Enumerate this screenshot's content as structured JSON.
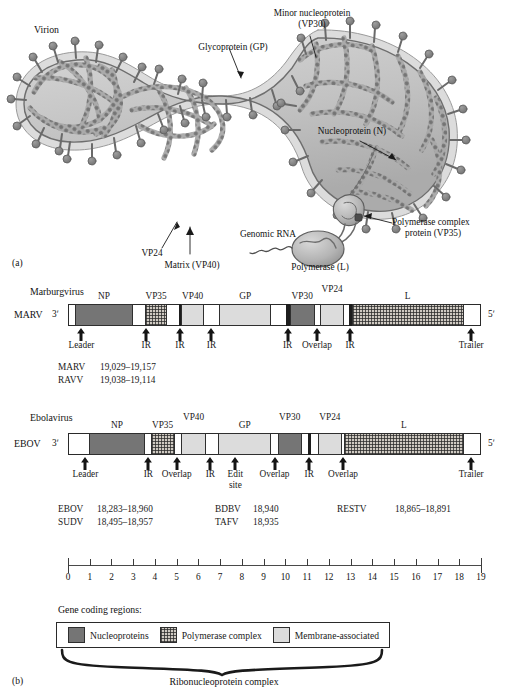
{
  "figure": {
    "panel_a_mark": "(a)",
    "panel_b_mark": "(b)",
    "virion_title": "Virion"
  },
  "virion_labels": {
    "minor_nucleoprotein": "Minor nucleoprotein",
    "minor_nucleoprotein_sub": "(VP30)",
    "glycoprotein": "Glycoprotein (GP)",
    "nucleoprotein": "Nucleoprotein (N)",
    "polymerase_complex": "Polymerase complex",
    "polymerase_complex_sub": "protein (VP35)",
    "genomic_rna": "Genomic RNA",
    "polymerase": "Polymerase (L)",
    "matrix": "Matrix (VP40)",
    "vp24": "VP24"
  },
  "marburg": {
    "genus": "Marburgvirus",
    "species": "MARV",
    "end_3": "3ʹ",
    "end_5": "5ʹ",
    "segments": [
      {
        "name": "",
        "type": "spacer",
        "x0": 0.0,
        "x1": 0.3
      },
      {
        "name": "NP",
        "type": "np",
        "x0": 0.3,
        "x1": 3.0
      },
      {
        "name": "",
        "type": "spacer",
        "x0": 3.0,
        "x1": 3.55
      },
      {
        "name": "VP35",
        "type": "poly",
        "x0": 3.55,
        "x1": 4.55
      },
      {
        "name": "",
        "type": "spacer",
        "x0": 4.55,
        "x1": 5.1
      },
      {
        "name": "",
        "type": "thin",
        "x0": 5.1,
        "x1": 5.22
      },
      {
        "name": "VP40",
        "type": "mem",
        "x0": 5.22,
        "x1": 6.25
      },
      {
        "name": "",
        "type": "spacer",
        "x0": 6.25,
        "x1": 6.95
      },
      {
        "name": "GP",
        "type": "mem",
        "x0": 6.95,
        "x1": 9.35
      },
      {
        "name": "",
        "type": "spacer",
        "x0": 9.35,
        "x1": 10.05
      },
      {
        "name": "",
        "type": "thin",
        "x0": 10.05,
        "x1": 10.2
      },
      {
        "name": "VP30",
        "type": "np",
        "x0": 10.2,
        "x1": 11.35
      },
      {
        "name": "",
        "type": "spacer",
        "x0": 11.35,
        "x1": 11.6
      },
      {
        "name": "VP24",
        "type": "mem",
        "x0": 11.6,
        "x1": 12.7
      },
      {
        "name": "",
        "type": "spacer",
        "x0": 12.7,
        "x1": 12.92
      },
      {
        "name": "",
        "type": "thin",
        "x0": 12.92,
        "x1": 13.05
      },
      {
        "name": "L",
        "type": "poly",
        "x0": 13.05,
        "x1": 18.2
      },
      {
        "name": "",
        "type": "spacer",
        "x0": 18.2,
        "x1": 19.0
      }
    ],
    "markers": [
      {
        "label": "Leader",
        "x": 0.62
      },
      {
        "label": "IR",
        "x": 3.6
      },
      {
        "label": "IR",
        "x": 5.15
      },
      {
        "label": "IR",
        "x": 6.6
      },
      {
        "label": "IR",
        "x": 10.1
      },
      {
        "label": "Overlap",
        "x": 11.45
      },
      {
        "label": "IR",
        "x": 12.98
      },
      {
        "label": "Trailer",
        "x": 18.55
      }
    ],
    "sizes": [
      {
        "species": "MARV",
        "range": "19,029–19,157"
      },
      {
        "species": "RAVV",
        "range": "19,038–19,114"
      }
    ]
  },
  "ebola": {
    "genus": "Ebolavirus",
    "species": "EBOV",
    "end_3": "3ʹ",
    "end_5": "5ʹ",
    "segments": [
      {
        "name": "",
        "type": "spacer",
        "x0": 0.0,
        "x1": 0.95
      },
      {
        "name": "NP",
        "type": "np",
        "x0": 0.95,
        "x1": 3.55
      },
      {
        "name": "",
        "type": "spacer",
        "x0": 3.55,
        "x1": 3.8
      },
      {
        "name": "VP35",
        "type": "poly",
        "x0": 3.8,
        "x1": 4.9
      },
      {
        "name": "",
        "type": "spacer",
        "x0": 4.9,
        "x1": 5.2
      },
      {
        "name": "VP40",
        "type": "mem",
        "x0": 5.2,
        "x1": 6.35
      },
      {
        "name": "",
        "type": "spacer",
        "x0": 6.35,
        "x1": 6.9
      },
      {
        "name": "GP",
        "type": "mem",
        "x0": 6.9,
        "x1": 9.35
      },
      {
        "name": "",
        "type": "spacer",
        "x0": 9.35,
        "x1": 9.65
      },
      {
        "name": "VP30",
        "type": "np",
        "x0": 9.65,
        "x1": 10.75
      },
      {
        "name": "",
        "type": "spacer",
        "x0": 10.75,
        "x1": 11.05
      },
      {
        "name": "",
        "type": "thin",
        "x0": 11.05,
        "x1": 11.2
      },
      {
        "name": "",
        "type": "spacer",
        "x0": 11.2,
        "x1": 11.5
      },
      {
        "name": "VP24",
        "type": "mem",
        "x0": 11.5,
        "x1": 12.6
      },
      {
        "name": "L",
        "type": "poly",
        "x0": 12.7,
        "x1": 18.2
      },
      {
        "name": "",
        "type": "spacer",
        "x0": 18.2,
        "x1": 19.0
      }
    ],
    "markers": [
      {
        "label": "Leader",
        "x": 0.8
      },
      {
        "label": "IR",
        "x": 3.7
      },
      {
        "label": "Overlap",
        "x": 5.0
      },
      {
        "label": "IR",
        "x": 6.55
      },
      {
        "label": "Edit\nsite",
        "x": 7.7
      },
      {
        "label": "Overlap",
        "x": 9.5
      },
      {
        "label": "IR",
        "x": 11.1
      },
      {
        "label": "Overlap",
        "x": 12.65
      },
      {
        "label": "Trailer",
        "x": 18.55
      }
    ],
    "sizes": [
      {
        "species": "EBOV",
        "range": "18,283–18,960"
      },
      {
        "species": "SUDV",
        "range": "18,495–18,957"
      },
      {
        "species": "BDBV",
        "range": "18,940"
      },
      {
        "species": "TAFV",
        "range": "18,935"
      },
      {
        "species": "RESTV",
        "range": "18,865–18,891"
      }
    ]
  },
  "scale": {
    "min": 0,
    "max": 19,
    "ticks": [
      "0",
      "1",
      "2",
      "3",
      "4",
      "5",
      "6",
      "7",
      "8",
      "9",
      "10",
      "11",
      "12",
      "13",
      "14",
      "15",
      "16",
      "17",
      "18",
      "19"
    ],
    "unit_note": ""
  },
  "legend": {
    "title": "Gene coding regions:",
    "items": [
      {
        "label": "Nucleoproteins",
        "swatch": "np",
        "color": "#757575"
      },
      {
        "label": "Polymerase complex",
        "swatch": "poly",
        "color": "#cfcac2"
      },
      {
        "label": "Membrane-associated",
        "swatch": "mem",
        "color": "#dcdcdc"
      }
    ],
    "brace_label": "Ribonucleoprotein complex"
  }
}
